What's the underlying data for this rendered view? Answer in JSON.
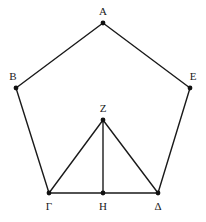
{
  "figure": {
    "canvas": {
      "width": 206,
      "height": 222,
      "background": "#ffffff"
    },
    "style": {
      "line_color": "#1a1a1a",
      "line_width": 1.4,
      "dot_color": "#111111",
      "dot_radius": 2.4,
      "label_color": "#1a1a1a",
      "label_font_size": 11
    },
    "points": [
      {
        "id": "A",
        "label": "A",
        "x": 103,
        "y": 23,
        "label_x": 103,
        "label_y": 11,
        "name": "vertex-a"
      },
      {
        "id": "B",
        "label": "B",
        "x": 16,
        "y": 88,
        "label_x": 13,
        "label_y": 76,
        "name": "vertex-b"
      },
      {
        "id": "Gamma",
        "label": "Γ",
        "x": 49,
        "y": 193,
        "label_x": 49,
        "label_y": 206,
        "name": "vertex-gamma"
      },
      {
        "id": "Delta",
        "label": "Δ",
        "x": 158,
        "y": 193,
        "label_x": 158,
        "label_y": 206,
        "name": "vertex-delta"
      },
      {
        "id": "E",
        "label": "E",
        "x": 190,
        "y": 88,
        "label_x": 193,
        "label_y": 76,
        "name": "vertex-e"
      },
      {
        "id": "Z",
        "label": "Z",
        "x": 103,
        "y": 120,
        "label_x": 103,
        "label_y": 108,
        "name": "vertex-z"
      },
      {
        "id": "H",
        "label": "H",
        "x": 103,
        "y": 193,
        "label_x": 103,
        "label_y": 206,
        "name": "vertex-h"
      }
    ],
    "edges": [
      {
        "id": "AB",
        "from": "A",
        "to": "B",
        "x1": 103,
        "y1": 23,
        "x2": 16,
        "y2": 88,
        "name": "edge-a-b"
      },
      {
        "id": "BG",
        "from": "B",
        "to": "Gamma",
        "x1": 16,
        "y1": 88,
        "x2": 49,
        "y2": 193,
        "name": "edge-b-gamma"
      },
      {
        "id": "GD",
        "from": "Gamma",
        "to": "Delta",
        "x1": 49,
        "y1": 193,
        "x2": 158,
        "y2": 193,
        "name": "edge-gamma-delta"
      },
      {
        "id": "DE",
        "from": "Delta",
        "to": "E",
        "x1": 158,
        "y1": 193,
        "x2": 190,
        "y2": 88,
        "name": "edge-delta-e"
      },
      {
        "id": "EA",
        "from": "E",
        "to": "A",
        "x1": 190,
        "y1": 88,
        "x2": 103,
        "y2": 23,
        "name": "edge-e-a"
      },
      {
        "id": "ZG",
        "from": "Z",
        "to": "Gamma",
        "x1": 103,
        "y1": 120,
        "x2": 49,
        "y2": 193,
        "name": "edge-z-gamma"
      },
      {
        "id": "ZD",
        "from": "Z",
        "to": "Delta",
        "x1": 103,
        "y1": 120,
        "x2": 158,
        "y2": 193,
        "name": "edge-z-delta"
      },
      {
        "id": "ZH",
        "from": "Z",
        "to": "H",
        "x1": 103,
        "y1": 120,
        "x2": 103,
        "y2": 193,
        "name": "edge-z-h"
      }
    ]
  }
}
